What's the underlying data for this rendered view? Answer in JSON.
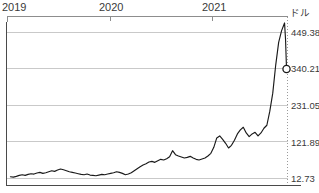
{
  "chart_data": {
    "type": "line",
    "title": "",
    "xlabel": "",
    "ylabel": "ドル",
    "grid": true,
    "legend": "none",
    "xlim": [
      2018.92,
      2021.78
    ],
    "ylim": [
      12.73,
      503.96
    ],
    "x_tick_labels": [
      "2019",
      "2020",
      "2021"
    ],
    "x_tick_values": [
      2019.0,
      2020.0,
      2021.0
    ],
    "y_tick_labels": [
      "449.38",
      "340.21",
      "231.05",
      "121.89",
      "12.73"
    ],
    "y_tick_values": [
      449.38,
      340.21,
      231.05,
      121.89,
      12.73
    ],
    "end_marker": {
      "label": "340.21",
      "value": 340.21,
      "shape": "open-circle"
    },
    "series": [
      {
        "name": "price",
        "color": "#1a1a1a",
        "x": [
          2018.96,
          2018.99,
          2019.02,
          2019.05,
          2019.08,
          2019.11,
          2019.14,
          2019.17,
          2019.2,
          2019.23,
          2019.26,
          2019.29,
          2019.32,
          2019.35,
          2019.38,
          2019.41,
          2019.44,
          2019.47,
          2019.5,
          2019.53,
          2019.56,
          2019.59,
          2019.62,
          2019.65,
          2019.68,
          2019.71,
          2019.74,
          2019.77,
          2019.8,
          2019.83,
          2019.86,
          2019.89,
          2019.92,
          2019.95,
          2019.98,
          2020.01,
          2020.04,
          2020.07,
          2020.1,
          2020.13,
          2020.16,
          2020.19,
          2020.22,
          2020.25,
          2020.28,
          2020.31,
          2020.34,
          2020.37,
          2020.4,
          2020.43,
          2020.46,
          2020.49,
          2020.52,
          2020.55,
          2020.58,
          2020.61,
          2020.64,
          2020.67,
          2020.7,
          2020.73,
          2020.76,
          2020.79,
          2020.82,
          2020.85,
          2020.88,
          2020.91,
          2020.94,
          2020.97,
          2021.0,
          2021.03,
          2021.06,
          2021.09,
          2021.12,
          2021.15,
          2021.18,
          2021.21,
          2021.24,
          2021.27,
          2021.3,
          2021.33,
          2021.36,
          2021.39,
          2021.42,
          2021.45,
          2021.48,
          2021.51,
          2021.54,
          2021.57,
          2021.6,
          2021.63,
          2021.66,
          2021.69,
          2021.72,
          2021.75
        ],
        "y": [
          18,
          17,
          19,
          22,
          24,
          22,
          25,
          27,
          26,
          29,
          31,
          28,
          30,
          33,
          36,
          34,
          38,
          41,
          39,
          36,
          33,
          31,
          29,
          27,
          25,
          24,
          26,
          23,
          22,
          21,
          23,
          25,
          24,
          26,
          28,
          30,
          33,
          31,
          28,
          24,
          26,
          30,
          36,
          42,
          48,
          53,
          57,
          62,
          64,
          61,
          66,
          70,
          68,
          72,
          78,
          96,
          84,
          80,
          77,
          74,
          76,
          79,
          74,
          70,
          68,
          71,
          74,
          80,
          88,
          106,
          134,
          140,
          130,
          118,
          104,
          112,
          127,
          146,
          158,
          166,
          149,
          138,
          146,
          151,
          140,
          149,
          163,
          172,
          214,
          268,
          352,
          420,
          455,
          478
        ]
      }
    ],
    "series_tail": {
      "x": [
        2021.75,
        2021.76,
        2021.77
      ],
      "y": [
        478,
        430,
        340.21
      ]
    }
  },
  "axis": {
    "y_title": "ドル"
  }
}
